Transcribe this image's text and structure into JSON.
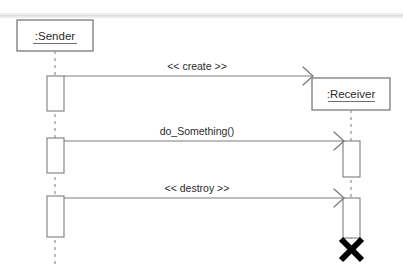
{
  "diagram": {
    "type": "uml-sequence-diagram",
    "background_color": "#ffffff",
    "line_color": "#7d7d7d",
    "text_color": "#2b2b2b",
    "destroy_marker_color": "#000000",
    "scan_artifact_color": "#ededed"
  },
  "participants": [
    {
      "id": "sender",
      "label": ":Sender",
      "underlined": true,
      "box": {
        "x": 17,
        "y": 20,
        "width": 76,
        "height": 31
      },
      "lifeline_x": 55,
      "lifeline_top": 51,
      "lifeline_bottom": 266,
      "destroyed": false
    },
    {
      "id": "receiver",
      "label": ":Receiver",
      "underlined": true,
      "box": {
        "x": 312,
        "y": 78,
        "width": 78,
        "height": 32
      },
      "lifeline_x": 351,
      "lifeline_top": 110,
      "lifeline_bottom": 238,
      "destroyed": true,
      "destroy_marker": {
        "cx": 351,
        "cy": 249,
        "size": 11
      }
    }
  ],
  "activations": [
    {
      "id": "sender-act-1",
      "participant": "sender",
      "x": 47,
      "y": 76,
      "width": 17,
      "height": 35
    },
    {
      "id": "sender-act-2",
      "participant": "sender",
      "x": 47,
      "y": 138,
      "width": 17,
      "height": 35
    },
    {
      "id": "sender-act-3",
      "participant": "sender",
      "x": 47,
      "y": 196,
      "width": 17,
      "height": 41
    },
    {
      "id": "receiver-act-1",
      "participant": "receiver",
      "x": 343,
      "y": 141,
      "width": 17,
      "height": 36
    },
    {
      "id": "receiver-act-2",
      "participant": "receiver",
      "x": 343,
      "y": 198,
      "width": 17,
      "height": 40
    }
  ],
  "messages": [
    {
      "id": "msg-create",
      "label": "<< create >>",
      "from": "sender",
      "to": "receiver",
      "kind": "create",
      "line_style": "solid",
      "arrowhead": "open",
      "x1": 64,
      "x2": 312,
      "y": 76,
      "label_x": 197,
      "label_y": 70
    },
    {
      "id": "msg-do-something",
      "label": "do_Something()",
      "from": "sender",
      "to": "receiver",
      "kind": "synchronous",
      "line_style": "solid",
      "arrowhead": "open",
      "x1": 64,
      "x2": 343,
      "y": 141,
      "label_x": 197,
      "label_y": 135
    },
    {
      "id": "msg-destroy",
      "label": "<< destroy >>",
      "from": "sender",
      "to": "receiver",
      "kind": "destroy",
      "line_style": "solid",
      "arrowhead": "open",
      "x1": 64,
      "x2": 343,
      "y": 198,
      "label_x": 197,
      "label_y": 192
    }
  ],
  "artifacts": [
    {
      "id": "scan-line-top",
      "y": 13,
      "height": 5
    }
  ]
}
